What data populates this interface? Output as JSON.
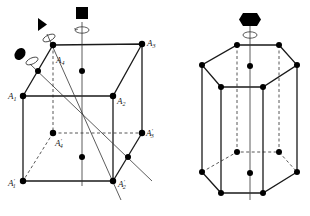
{
  "figures": [
    {
      "name": "cube",
      "labels": {
        "A1": "A",
        "A1_sub": "1",
        "A2": "A",
        "A2_sub": "2",
        "A3": "A",
        "A3_sub": "3",
        "A4": "A",
        "A4_sub": "4",
        "A1p": "A",
        "A1p_sub": "1",
        "A1p_prime": "′",
        "A2p": "A",
        "A2p_sub": "2",
        "A2p_prime": "′",
        "A3p": "A",
        "A3p_sub": "3",
        "A3p_prime": "′",
        "A4p": "A",
        "A4p_sub": "4",
        "A4p_prime": "′"
      },
      "symmetry_axes": [
        {
          "symbol": "square",
          "fold": 4,
          "description": "4-fold axis through face centers"
        },
        {
          "symbol": "triangle",
          "fold": 3,
          "description": "3-fold axis along body diagonal"
        },
        {
          "symbol": "ellipse",
          "fold": 2,
          "description": "2-fold axis through edge midpoints"
        }
      ]
    },
    {
      "name": "hexagonal-prism",
      "symmetry_axes": [
        {
          "symbol": "hexagon",
          "fold": 6,
          "description": "6-fold axis through hexagon centers"
        }
      ]
    }
  ],
  "colors": {
    "stroke": "#1a1a1a",
    "point": "#000000",
    "background": "#ffffff"
  }
}
